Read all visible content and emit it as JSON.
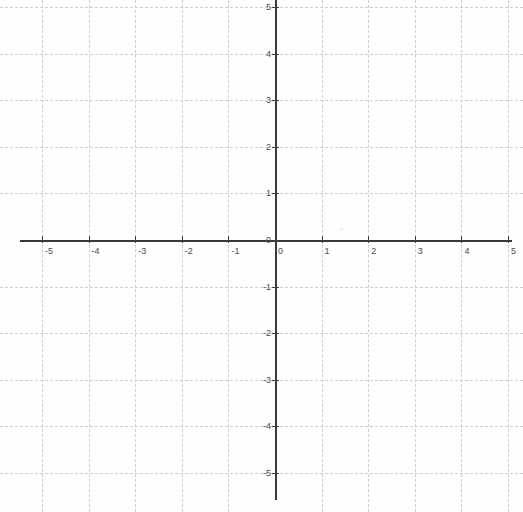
{
  "chart_data": {
    "type": "scatter",
    "title": "",
    "subtitle": "",
    "xlabel": "",
    "ylabel": "",
    "xlim": [
      -5.5,
      5.3
    ],
    "ylim": [
      -5.8,
      5.2
    ],
    "grid": true,
    "grid_style": "dashed",
    "grid_color": "#cfcfcf",
    "axis_color": "#3b3b3b",
    "background_color": "#fefefe",
    "legend": null,
    "legend_position": "none",
    "series": [],
    "x_ticks": [
      -5,
      -4,
      -3,
      -2,
      -1,
      0,
      1,
      2,
      3,
      4,
      5
    ],
    "y_ticks": [
      -5,
      -4,
      -3,
      -2,
      -1,
      0,
      1,
      2,
      3,
      4,
      5
    ],
    "x_tick_labels": [
      "-5",
      "-4",
      "-3",
      "-2",
      "-1",
      "0",
      "1",
      "2",
      "3",
      "4",
      "5"
    ],
    "y_tick_labels": [
      "-5",
      "-4",
      "-3",
      "-2",
      "-1",
      "0",
      "1",
      "2",
      "3",
      "4",
      "5"
    ],
    "origin_px": [
      275,
      240
    ],
    "unit_px": 46.6,
    "annotations": []
  },
  "axes": {
    "x_axis_label": "",
    "y_axis_label": "",
    "origin_label": "0"
  },
  "grid": {
    "vertical_values": [
      -5,
      -4,
      -3,
      -2,
      -1,
      1,
      2,
      3,
      4,
      5
    ],
    "horizontal_values": [
      -5,
      -4,
      -3,
      -2,
      -1,
      1,
      2,
      3,
      4,
      5
    ]
  }
}
